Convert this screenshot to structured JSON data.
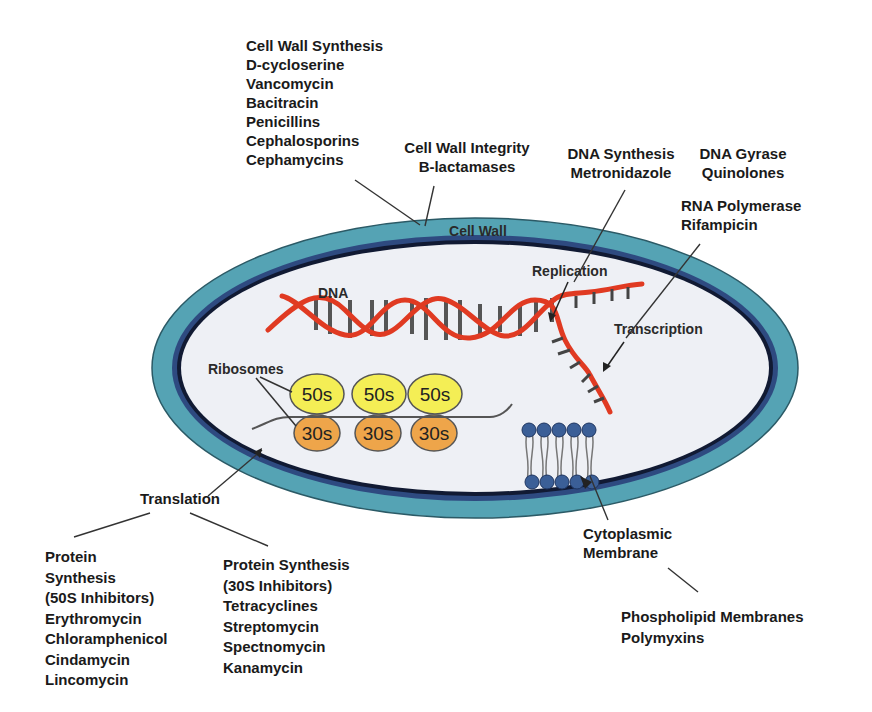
{
  "colors": {
    "cell_wall": "#55a3b4",
    "membrane": "#2e4a80",
    "cytoplasm": "#eef0f5",
    "dna": "#e03a22",
    "rung": "#555555",
    "ribosome_50s": "#f4ee55",
    "ribosome_30s": "#eea54a",
    "phospholipid": "#3b5f97"
  },
  "labels": {
    "cell_wall_synthesis": {
      "title": "Cell Wall Synthesis",
      "drugs": [
        "D-cycloserine",
        "Vancomycin",
        "Bacitracin",
        "Penicillins",
        "Cephalosporins",
        "Cephamycins"
      ]
    },
    "cell_wall_integrity": {
      "title": "Cell Wall Integrity",
      "drugs": [
        "B-lactamases"
      ]
    },
    "dna_synthesis": {
      "title": "DNA Synthesis",
      "drugs": [
        "Metronidazole"
      ]
    },
    "dna_gyrase": {
      "title": "DNA Gyrase",
      "drugs": [
        "Quinolones"
      ]
    },
    "rna_polymerase": {
      "title": "RNA Polymerase",
      "drugs": [
        "Rifampicin"
      ]
    },
    "translation": "Translation",
    "protein_50s": {
      "title_lines": [
        "Protein",
        "Synthesis",
        "(50S Inhibitors)"
      ],
      "drugs": [
        "Erythromycin",
        "Chloramphenicol",
        "Cindamycin",
        "Lincomycin"
      ]
    },
    "protein_30s": {
      "title_lines": [
        "Protein Synthesis",
        "(30S Inhibitors)"
      ],
      "drugs": [
        "Tetracyclines",
        "Streptomycin",
        "Spectnomycin",
        "Kanamycin"
      ]
    },
    "cytoplasmic_membrane": [
      "Cytoplasmic",
      "Membrane"
    ],
    "phospholipid": {
      "title": "Phospholipid Membranes",
      "drugs": [
        "Polymyxins"
      ]
    }
  },
  "cell": {
    "cell_wall_label": "Cell Wall",
    "dna_label": "DNA",
    "replication_label": "Replication",
    "transcription_label": "Transcription",
    "ribosomes_label": "Ribosomes",
    "ribosomes": [
      {
        "large": "50s",
        "small": "30s"
      },
      {
        "large": "50s",
        "small": "30s"
      },
      {
        "large": "50s",
        "small": "30s"
      }
    ]
  }
}
